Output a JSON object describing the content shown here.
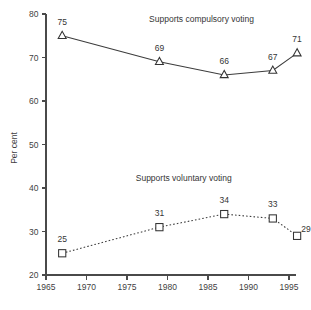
{
  "chart_data": {
    "type": "line",
    "title": "",
    "xlabel": "",
    "ylabel": "Per cent",
    "xlim": [
      1965,
      1996.8
    ],
    "ylim": [
      20,
      80
    ],
    "grid": false,
    "legend": "inline-annotations",
    "x_ticks": [
      "1965",
      "1970",
      "1975",
      "1980",
      "1985",
      "1990",
      "1995"
    ],
    "x_tick_values": [
      1965,
      1970,
      1975,
      1980,
      1985,
      1990,
      1995
    ],
    "y_ticks": [
      "20",
      "30",
      "40",
      "50",
      "60",
      "70",
      "80"
    ],
    "y_tick_values": [
      20,
      30,
      40,
      50,
      60,
      70,
      80
    ],
    "series": [
      {
        "name": "Supports compulsory voting",
        "annotation": "Supports compulsory voting",
        "marker": "open-triangle",
        "line_style": "solid",
        "x": [
          1967,
          1979,
          1987,
          1993,
          1996
        ],
        "values": [
          75,
          69,
          66,
          67,
          71
        ],
        "point_labels": [
          "75",
          "69",
          "66",
          "67",
          "71"
        ]
      },
      {
        "name": "Supports voluntary voting",
        "annotation": "Supports voluntary voting",
        "marker": "open-square",
        "line_style": "dotted",
        "x": [
          1967,
          1979,
          1987,
          1993,
          1996
        ],
        "values": [
          25,
          31,
          34,
          33,
          29
        ],
        "point_labels": [
          "25",
          "31",
          "34",
          "33",
          "29"
        ]
      }
    ],
    "annotations": [
      {
        "text": "Supports compulsory voting",
        "x": 1984.2,
        "y": 78.1
      },
      {
        "text": "Supports voluntary voting",
        "x": 1982.0,
        "y": 41.6
      }
    ]
  }
}
